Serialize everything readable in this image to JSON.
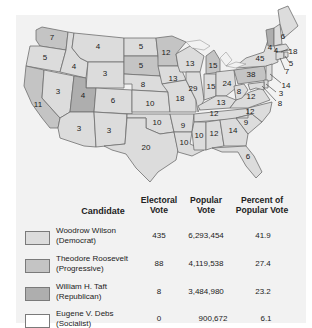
{
  "colors": {
    "wilson": "#dcdcdc",
    "roosevelt": "#c4c4c4",
    "taft": "#aeaeae",
    "debs": "#ffffff",
    "panel": "#f2f2f2",
    "border": "#6e6e6e"
  },
  "map": {
    "states": [
      {
        "abbr": "WA",
        "votes": "7",
        "winner": "roosevelt"
      },
      {
        "abbr": "OR",
        "votes": "5",
        "winner": "wilson"
      },
      {
        "abbr": "CA",
        "votes": "11",
        "winner": "roosevelt"
      },
      {
        "abbr": "ID",
        "votes": "4",
        "winner": "wilson"
      },
      {
        "abbr": "NV",
        "votes": "3",
        "winner": "wilson"
      },
      {
        "abbr": "MT",
        "votes": "4",
        "winner": "wilson"
      },
      {
        "abbr": "WY",
        "votes": "3",
        "winner": "wilson"
      },
      {
        "abbr": "UT",
        "votes": "4",
        "winner": "taft"
      },
      {
        "abbr": "AZ",
        "votes": "3",
        "winner": "wilson"
      },
      {
        "abbr": "CO",
        "votes": "6",
        "winner": "wilson"
      },
      {
        "abbr": "NM",
        "votes": "3",
        "winner": "wilson"
      },
      {
        "abbr": "ND",
        "votes": "5",
        "winner": "wilson"
      },
      {
        "abbr": "SD",
        "votes": "5",
        "winner": "roosevelt"
      },
      {
        "abbr": "NE",
        "votes": "8",
        "winner": "wilson"
      },
      {
        "abbr": "KS",
        "votes": "10",
        "winner": "wilson"
      },
      {
        "abbr": "OK",
        "votes": "10",
        "winner": "wilson"
      },
      {
        "abbr": "TX",
        "votes": "20",
        "winner": "wilson"
      },
      {
        "abbr": "MN",
        "votes": "12",
        "winner": "roosevelt"
      },
      {
        "abbr": "IA",
        "votes": "13",
        "winner": "wilson"
      },
      {
        "abbr": "MO",
        "votes": "18",
        "winner": "wilson"
      },
      {
        "abbr": "AR",
        "votes": "9",
        "winner": "wilson"
      },
      {
        "abbr": "LA",
        "votes": "10",
        "winner": "wilson"
      },
      {
        "abbr": "WI",
        "votes": "13",
        "winner": "wilson"
      },
      {
        "abbr": "IL",
        "votes": "29",
        "winner": "wilson"
      },
      {
        "abbr": "MI",
        "votes": "15",
        "winner": "roosevelt"
      },
      {
        "abbr": "IN",
        "votes": "15",
        "winner": "wilson"
      },
      {
        "abbr": "OH",
        "votes": "24",
        "winner": "wilson"
      },
      {
        "abbr": "KY",
        "votes": "13",
        "winner": "wilson"
      },
      {
        "abbr": "TN",
        "votes": "12",
        "winner": "wilson"
      },
      {
        "abbr": "MS",
        "votes": "10",
        "winner": "wilson"
      },
      {
        "abbr": "AL",
        "votes": "12",
        "winner": "wilson"
      },
      {
        "abbr": "GA",
        "votes": "14",
        "winner": "wilson"
      },
      {
        "abbr": "FL",
        "votes": "6",
        "winner": "wilson"
      },
      {
        "abbr": "SC",
        "votes": "9",
        "winner": "wilson"
      },
      {
        "abbr": "NC",
        "votes": "12",
        "winner": "wilson"
      },
      {
        "abbr": "VA",
        "votes": "12",
        "winner": "wilson"
      },
      {
        "abbr": "WV",
        "votes": "8",
        "winner": "wilson"
      },
      {
        "abbr": "PA",
        "votes": "38",
        "winner": "roosevelt"
      },
      {
        "abbr": "NY",
        "votes": "45",
        "winner": "wilson"
      },
      {
        "abbr": "VT",
        "votes": "4",
        "winner": "taft"
      },
      {
        "abbr": "NH",
        "votes": "4",
        "winner": "wilson"
      },
      {
        "abbr": "ME",
        "votes": "6",
        "winner": "wilson"
      },
      {
        "abbr": "MA",
        "votes": "18",
        "winner": "wilson"
      },
      {
        "abbr": "RI",
        "votes": "5",
        "winner": "wilson"
      },
      {
        "abbr": "CT",
        "votes": "7",
        "winner": "wilson"
      },
      {
        "abbr": "NJ",
        "votes": "14",
        "winner": "wilson"
      },
      {
        "abbr": "DE",
        "votes": "3",
        "winner": "wilson"
      },
      {
        "abbr": "MD",
        "votes": "8",
        "winner": "wilson"
      }
    ]
  },
  "table": {
    "headers": {
      "candidate": "Candidate",
      "electoral_1": "Electoral",
      "electoral_2": "Vote",
      "popular_1": "Popular",
      "popular_2": "Vote",
      "percent_1": "Percent of",
      "percent_2": "Popular Vote"
    },
    "rows": [
      {
        "name": "Woodrow Wilson",
        "party": "(Democrat)",
        "electoral": "435",
        "popular": "6,293,454",
        "percent": "41.9",
        "color": "#dcdcdc"
      },
      {
        "name": "Theodore Roosevelt",
        "party": "(Progressive)",
        "electoral": "88",
        "popular": "4,119,538",
        "percent": "27.4",
        "color": "#c4c4c4"
      },
      {
        "name": "William H. Taft",
        "party": "(Republican)",
        "electoral": "8",
        "popular": "3,484,980",
        "percent": "23.2",
        "color": "#aeaeae"
      },
      {
        "name": "Eugene V. Debs",
        "party": "(Socialist)",
        "electoral": "0",
        "popular": "900,672",
        "percent": "6.1",
        "color": "#ffffff"
      }
    ]
  }
}
